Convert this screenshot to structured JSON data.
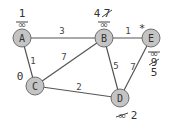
{
  "graph": {
    "nodes": {
      "A": {
        "label": "A",
        "distance": "1",
        "crossed_out": [
          "∞"
        ]
      },
      "B": {
        "label": "B",
        "distance": "4",
        "crossed_out": [
          "7",
          "∞"
        ]
      },
      "C": {
        "label": "C",
        "distance": "0",
        "crossed_out": []
      },
      "D": {
        "label": "D",
        "distance": "2",
        "crossed_out": [
          "∞"
        ]
      },
      "E": {
        "label": "E",
        "distance": "5",
        "crossed_out": [
          "∞",
          "9"
        ],
        "marker": "*"
      }
    },
    "edges": [
      {
        "from": "A",
        "to": "B",
        "weight": "3"
      },
      {
        "from": "B",
        "to": "E",
        "weight": "1"
      },
      {
        "from": "A",
        "to": "C",
        "weight": "1"
      },
      {
        "from": "C",
        "to": "B",
        "weight": "7"
      },
      {
        "from": "B",
        "to": "D",
        "weight": "5"
      },
      {
        "from": "E",
        "to": "D",
        "weight": "7"
      },
      {
        "from": "C",
        "to": "D",
        "weight": "2"
      }
    ]
  }
}
